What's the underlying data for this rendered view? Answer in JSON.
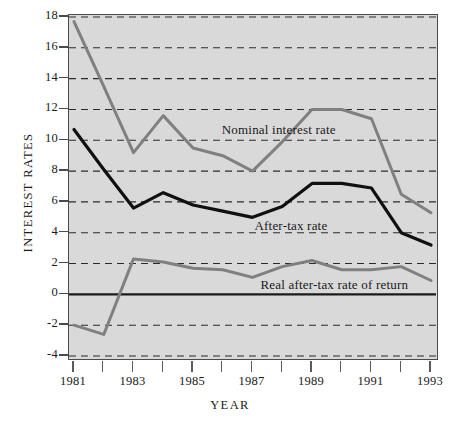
{
  "chart_data": {
    "type": "line",
    "title": "",
    "xlabel": "YEAR",
    "ylabel": "INTEREST RATES",
    "x": [
      1981,
      1982,
      1983,
      1984,
      1985,
      1986,
      1987,
      1988,
      1989,
      1990,
      1991,
      1992,
      1993
    ],
    "xlim": [
      1981,
      1993
    ],
    "ylim": [
      -4,
      18
    ],
    "yticks": [
      -4,
      -2,
      0,
      2,
      4,
      6,
      8,
      10,
      12,
      14,
      16,
      18
    ],
    "ytick_labels": [
      "-4",
      "-2",
      "0",
      "2",
      "4",
      "6",
      "8",
      "10",
      "12",
      "14",
      "16",
      "18"
    ],
    "xticks": [
      1981,
      1982,
      1983,
      1984,
      1985,
      1986,
      1987,
      1988,
      1989,
      1990,
      1991,
      1992,
      1993
    ],
    "xtick_labels": [
      "1981",
      "",
      "1983",
      "",
      "1985",
      "",
      "1987",
      "",
      "1989",
      "",
      "1991",
      "",
      "1993"
    ],
    "grid": "horizontal-dashed",
    "zero_line": true,
    "legend_position": "inline-annotations",
    "plot_background": "#d9d9d9",
    "series": [
      {
        "name": "Nominal interest rate",
        "color": "#808080",
        "values": [
          17.7,
          13.5,
          9.2,
          11.6,
          9.5,
          9.0,
          8.0,
          9.9,
          12.0,
          12.0,
          11.4,
          6.5,
          5.3
        ],
        "annotation": "Nominal interest rate",
        "annotation_x": 1986.0,
        "annotation_y": 10.6
      },
      {
        "name": "After-tax rate",
        "color": "#101010",
        "values": [
          10.7,
          8.1,
          5.6,
          6.6,
          5.8,
          5.4,
          5.0,
          5.7,
          7.2,
          7.2,
          6.9,
          4.0,
          3.2
        ],
        "annotation": "After-tax rate",
        "annotation_x": 1987.1,
        "annotation_y": 4.4
      },
      {
        "name": "Real after-tax rate of return",
        "color": "#808080",
        "values": [
          -2.0,
          -2.6,
          2.3,
          2.1,
          1.7,
          1.6,
          1.1,
          1.8,
          2.2,
          1.6,
          1.6,
          1.8,
          0.9
        ],
        "annotation": "Real after-tax rate of return",
        "annotation_x": 1987.3,
        "annotation_y": 0.55
      }
    ]
  }
}
